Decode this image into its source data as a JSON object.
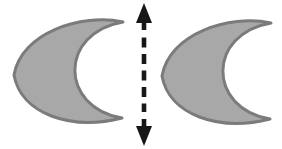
{
  "canvas": {
    "width": 282,
    "height": 149,
    "background": "#ffffff"
  },
  "crescents": {
    "count": 2,
    "shape": "crescent-opening-right",
    "fill": "#a8a8a8",
    "outline": "#7b7b7b"
  },
  "arrow": {
    "style": "dashed",
    "orientation": "vertical",
    "arrowheads": "both-ends",
    "color": "#171717"
  }
}
